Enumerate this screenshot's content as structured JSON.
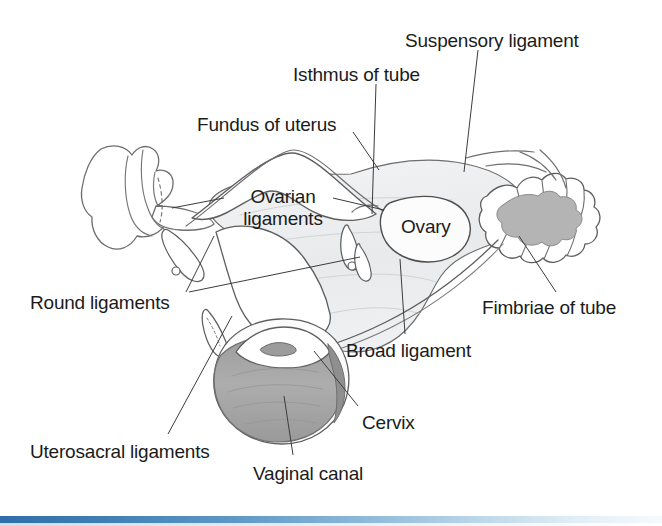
{
  "figure": {
    "background_color": "#ffffff",
    "line_color": "#4a4a4a",
    "broad_ligament_fill": "#eceef0",
    "ovary_fill": "#fdfdfd",
    "vaginal_canal_fill": "#a9a9a9",
    "cervix_rim_fill": "#8f8f8f",
    "fimbriae_fill": "#b8b8b8",
    "accent_bar_color": "#2f6ea8"
  },
  "labels": [
    {
      "id": "suspensory-ligament",
      "text": "Suspensory ligament",
      "x": 405,
      "y": 30
    },
    {
      "id": "isthmus-of-tube",
      "text": "Isthmus of tube",
      "x": 293,
      "y": 64
    },
    {
      "id": "fundus-of-uterus",
      "text": "Fundus of uterus",
      "x": 197,
      "y": 114
    },
    {
      "id": "ovarian-ligaments",
      "text": "Ovarian\nligaments",
      "x": 226,
      "y": 186
    },
    {
      "id": "ovary",
      "text": "Ovary",
      "x": 401,
      "y": 216
    },
    {
      "id": "round-ligaments",
      "text": "Round ligaments",
      "x": 30,
      "y": 292
    },
    {
      "id": "fimbriae-of-tube",
      "text": "Fimbriae of tube",
      "x": 482,
      "y": 297
    },
    {
      "id": "broad-ligament",
      "text": "Broad ligament",
      "x": 346,
      "y": 340
    },
    {
      "id": "cervix",
      "text": "Cervix",
      "x": 362,
      "y": 412
    },
    {
      "id": "uterosacral-ligaments",
      "text": "Uterosacral ligaments",
      "x": 30,
      "y": 441
    },
    {
      "id": "vaginal-canal",
      "text": "Vaginal canal",
      "x": 253,
      "y": 463
    }
  ],
  "leader_lines": [
    {
      "id": "suspensory-ligament-leader",
      "from": [
        478,
        50
      ],
      "to": [
        466,
        170
      ]
    },
    {
      "id": "isthmus-of-tube-leader",
      "from": [
        376,
        84
      ],
      "to": [
        372,
        212
      ]
    },
    {
      "id": "fundus-of-uterus-leader",
      "from": [
        353,
        133
      ],
      "to": [
        377,
        168
      ]
    },
    {
      "id": "ovarian-ligaments-leader-left",
      "from": [
        224,
        196
      ],
      "to": [
        175,
        206
      ]
    },
    {
      "id": "ovarian-ligaments-leader-right",
      "from": [
        333,
        196
      ],
      "to": [
        382,
        208
      ]
    },
    {
      "id": "round-ligaments-leader-left",
      "from": [
        185,
        289
      ],
      "to": [
        216,
        235
      ]
    },
    {
      "id": "round-ligaments-leader-right",
      "from": [
        188,
        289
      ],
      "to": [
        358,
        258
      ]
    },
    {
      "id": "fimbriae-of-tube-leader",
      "from": [
        556,
        292
      ],
      "to": [
        519,
        236
      ]
    },
    {
      "id": "broad-ligament-leader",
      "from": [
        404,
        333
      ],
      "to": [
        400,
        260
      ]
    },
    {
      "id": "cervix-leader",
      "from": [
        358,
        405
      ],
      "to": [
        316,
        352
      ]
    },
    {
      "id": "uterosacral-ligaments-leader",
      "from": [
        168,
        434
      ],
      "to": [
        230,
        318
      ]
    },
    {
      "id": "vaginal-canal-leader",
      "from": [
        292,
        455
      ],
      "to": [
        283,
        396
      ]
    }
  ],
  "structures": [
    {
      "id": "left-fimbriae",
      "name": "left fimbriae of tube"
    },
    {
      "id": "left-ovary",
      "name": "left ovary"
    },
    {
      "id": "uterine-body",
      "name": "fundus and body of uterus"
    },
    {
      "id": "broad-ligament",
      "name": "broad ligament"
    },
    {
      "id": "right-ovary",
      "name": "right ovary"
    },
    {
      "id": "right-fimbriae",
      "name": "right fimbriae of tube"
    },
    {
      "id": "round-ligament-left",
      "name": "left round ligament"
    },
    {
      "id": "round-ligament-right",
      "name": "right round ligament"
    },
    {
      "id": "cervix",
      "name": "cervix"
    },
    {
      "id": "vaginal-canal",
      "name": "vaginal canal"
    }
  ]
}
